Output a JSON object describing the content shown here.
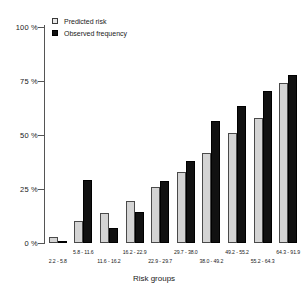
{
  "chart_data": {
    "type": "bar",
    "title": "",
    "xlabel": "Risk groups",
    "ylabel": "",
    "ylim": [
      0,
      100
    ],
    "ytick_labels": [
      "0 %",
      "25 %",
      "50 %",
      "75 %",
      "100 %"
    ],
    "ytick_values": [
      0,
      25,
      50,
      75,
      100
    ],
    "grid": false,
    "legend_position": "top-left",
    "categories": [
      "2.2 - 5.8",
      "5.8 - 11.6",
      "11.6 - 16.2",
      "16.2 - 22.9",
      "22.9 - 29.7",
      "29.7 - 38.0",
      "38.0 - 49.2",
      "49.2 - 55.2",
      "55.2 - 64.3",
      "64.3 - 91.9"
    ],
    "series": [
      {
        "name": "Predicted risk",
        "color": "#d4d4d4",
        "values": [
          3,
          10,
          14,
          19.5,
          26,
          33,
          41.5,
          51,
          58,
          74
        ]
      },
      {
        "name": "Observed frequency",
        "color": "#111111",
        "values": [
          0,
          29,
          7,
          14.5,
          28.5,
          38,
          56.5,
          63.5,
          70.5,
          78
        ]
      }
    ]
  },
  "legend": {
    "items": [
      {
        "label": "Predicted risk",
        "swatch": "light-square-icon"
      },
      {
        "label": "Observed frequency",
        "swatch": "black-square-icon"
      }
    ]
  }
}
